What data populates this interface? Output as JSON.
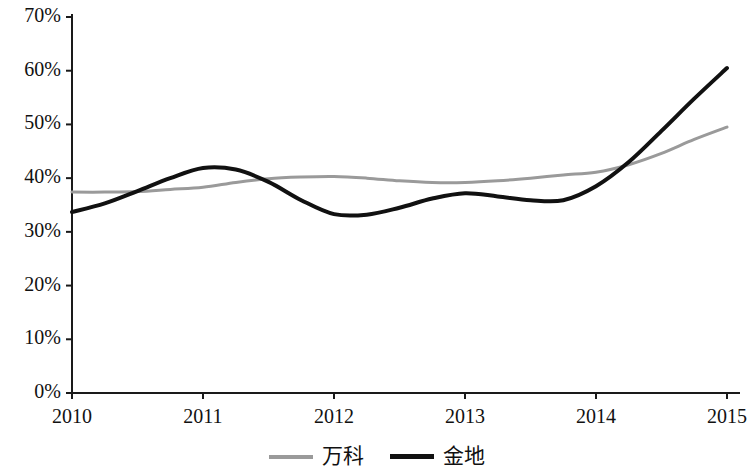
{
  "chart_data": {
    "type": "line",
    "title": "",
    "xlabel": "",
    "ylabel": "",
    "categories": [
      "2010",
      "2011",
      "2012",
      "2013",
      "2014",
      "2015"
    ],
    "x": [
      2010,
      2011,
      2012,
      2013,
      2014,
      2015
    ],
    "xlim": [
      2010,
      2015
    ],
    "ylim": [
      0,
      70
    ],
    "y_unit": "%",
    "grid": false,
    "legend_position": "bottom-center",
    "y_ticks": [
      0,
      10,
      20,
      30,
      40,
      50,
      60,
      70
    ],
    "y_tick_labels": [
      "0%",
      "10%",
      "20%",
      "30%",
      "40%",
      "50%",
      "60%",
      "70%"
    ],
    "x_tick_labels": [
      "2010",
      "2011",
      "2012",
      "2013",
      "2014",
      "2015"
    ],
    "series": [
      {
        "name": "万科",
        "color": "#9a9a9a",
        "width": 3,
        "values": [
          37.4,
          38.3,
          40.3,
          39.2,
          41.1,
          49.5
        ],
        "smooth_points": [
          [
            2010.0,
            37.4
          ],
          [
            2010.25,
            37.4
          ],
          [
            2010.5,
            37.5
          ],
          [
            2010.75,
            37.9
          ],
          [
            2011.0,
            38.3
          ],
          [
            2011.25,
            39.2
          ],
          [
            2011.5,
            39.9
          ],
          [
            2011.75,
            40.2
          ],
          [
            2012.0,
            40.3
          ],
          [
            2012.25,
            40.0
          ],
          [
            2012.5,
            39.5
          ],
          [
            2012.75,
            39.2
          ],
          [
            2013.0,
            39.2
          ],
          [
            2013.25,
            39.5
          ],
          [
            2013.5,
            40.0
          ],
          [
            2013.75,
            40.6
          ],
          [
            2014.0,
            41.1
          ],
          [
            2014.25,
            42.5
          ],
          [
            2014.5,
            44.6
          ],
          [
            2014.75,
            47.2
          ],
          [
            2015.0,
            49.5
          ]
        ]
      },
      {
        "name": "金地",
        "color": "#111111",
        "width": 4,
        "values": [
          33.7,
          41.9,
          33.3,
          37.2,
          38.5,
          60.5
        ],
        "smooth_points": [
          [
            2010.0,
            33.7
          ],
          [
            2010.25,
            35.3
          ],
          [
            2010.5,
            37.6
          ],
          [
            2010.75,
            40.0
          ],
          [
            2011.0,
            41.9
          ],
          [
            2011.25,
            41.6
          ],
          [
            2011.5,
            39.3
          ],
          [
            2011.75,
            35.9
          ],
          [
            2012.0,
            33.3
          ],
          [
            2012.25,
            33.2
          ],
          [
            2012.5,
            34.5
          ],
          [
            2012.75,
            36.2
          ],
          [
            2013.0,
            37.2
          ],
          [
            2013.25,
            36.6
          ],
          [
            2013.5,
            35.9
          ],
          [
            2013.75,
            35.9
          ],
          [
            2014.0,
            38.5
          ],
          [
            2014.25,
            43.0
          ],
          [
            2014.5,
            48.8
          ],
          [
            2014.75,
            54.8
          ],
          [
            2015.0,
            60.5
          ]
        ]
      }
    ],
    "annotations": [
      {
        "text": "金地 crosses above 万科 between 2014 and 2015",
        "visible": false
      }
    ]
  },
  "axes": {
    "axis_color": "#1a1a1a",
    "axis_width": 2,
    "tick_length": 6
  },
  "legend": {
    "items": [
      {
        "label": "万科",
        "swatch": "gray"
      },
      {
        "label": "金地",
        "swatch": "black"
      }
    ]
  }
}
